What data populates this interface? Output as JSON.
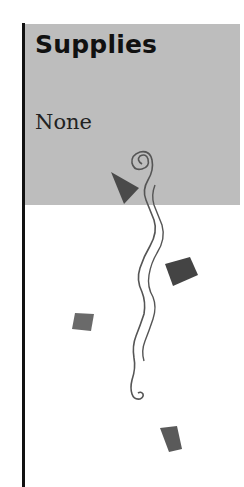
{
  "section": {
    "title": "Supplies",
    "content": "None"
  },
  "colors": {
    "panel": "#bdbdbd",
    "rule": "#111111",
    "ornament": "#555555"
  },
  "decor": {
    "icon": "vine-ornament-icon"
  }
}
